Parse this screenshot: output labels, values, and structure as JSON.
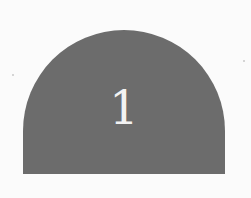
{
  "badge": {
    "shape": "arch",
    "label": "1",
    "fill_color": "#6c6c6c",
    "text_color": "#f2f2f2",
    "background_color": "#fbfbfb"
  }
}
